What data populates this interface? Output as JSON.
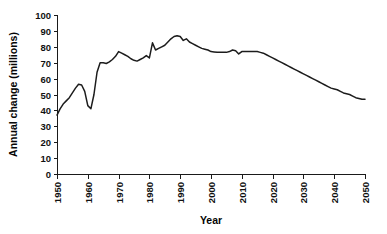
{
  "chart_data": {
    "type": "line",
    "title": "",
    "xlabel": "Year",
    "ylabel": "Annual change (millions)",
    "xlim": [
      1950,
      2050
    ],
    "ylim": [
      0,
      100
    ],
    "grid": false,
    "legend": "none",
    "xticks": [
      1950,
      1960,
      1970,
      1980,
      1990,
      2000,
      2010,
      2020,
      2030,
      2040,
      2050
    ],
    "yticks": [
      0,
      10,
      20,
      30,
      40,
      50,
      60,
      70,
      80,
      90,
      100
    ],
    "xtick_labels": [
      "1950",
      "1960",
      "1970",
      "1980",
      "1990",
      "2000",
      "2010",
      "2020",
      "2030",
      "2040",
      "2050"
    ],
    "ytick_labels": [
      "0",
      "10",
      "20",
      "30",
      "40",
      "50",
      "60",
      "70",
      "80",
      "90",
      "100"
    ],
    "xtick_rotation": 90,
    "line_color": "#1c1c1c",
    "series": [
      {
        "name": "Annual change",
        "x": [
          1950,
          1951,
          1952,
          1953,
          1954,
          1955,
          1956,
          1957,
          1958,
          1959,
          1960,
          1961,
          1962,
          1963,
          1964,
          1965,
          1966,
          1967,
          1968,
          1969,
          1970,
          1971,
          1972,
          1973,
          1974,
          1975,
          1976,
          1977,
          1978,
          1979,
          1980,
          1981,
          1982,
          1983,
          1984,
          1985,
          1986,
          1987,
          1988,
          1989,
          1990,
          1991,
          1992,
          1993,
          1994,
          1995,
          1996,
          1997,
          1998,
          1999,
          2000,
          2001,
          2002,
          2003,
          2004,
          2005,
          2006,
          2007,
          2008,
          2009,
          2010,
          2011,
          2012,
          2013,
          2014,
          2015,
          2016,
          2017,
          2018,
          2019,
          2020,
          2021,
          2022,
          2023,
          2024,
          2025,
          2026,
          2027,
          2028,
          2029,
          2030,
          2031,
          2032,
          2033,
          2034,
          2035,
          2036,
          2037,
          2038,
          2039,
          2040,
          2041,
          2042,
          2043,
          2044,
          2045,
          2046,
          2047,
          2048,
          2049,
          2050
        ],
        "values": [
          37,
          41,
          44,
          46,
          48,
          51,
          54,
          56.5,
          56,
          52,
          43,
          41,
          50,
          64,
          70,
          70,
          69.5,
          70.5,
          72,
          74,
          77,
          76,
          75,
          74,
          72.5,
          71.5,
          71,
          72,
          73,
          74.5,
          73,
          82.5,
          78,
          79,
          80,
          81,
          83,
          85,
          86.5,
          87,
          86.5,
          84,
          85,
          83,
          82,
          81,
          80,
          79,
          78.5,
          78,
          77,
          76.8,
          76.5,
          76.5,
          76.5,
          76.5,
          77,
          78,
          77.5,
          75.5,
          77,
          77,
          77,
          77,
          77,
          77,
          76.5,
          76,
          75,
          74,
          73,
          72,
          71,
          70,
          69,
          68,
          67,
          66,
          65,
          64,
          63,
          62,
          61,
          60,
          59,
          58,
          57,
          56,
          55,
          54,
          53.5,
          53,
          52,
          51,
          50.5,
          50,
          49,
          48,
          47.5,
          47,
          47
        ]
      }
    ]
  },
  "layout": {
    "plot_left": 57,
    "plot_right": 365,
    "plot_top": 15,
    "plot_bottom": 174
  }
}
